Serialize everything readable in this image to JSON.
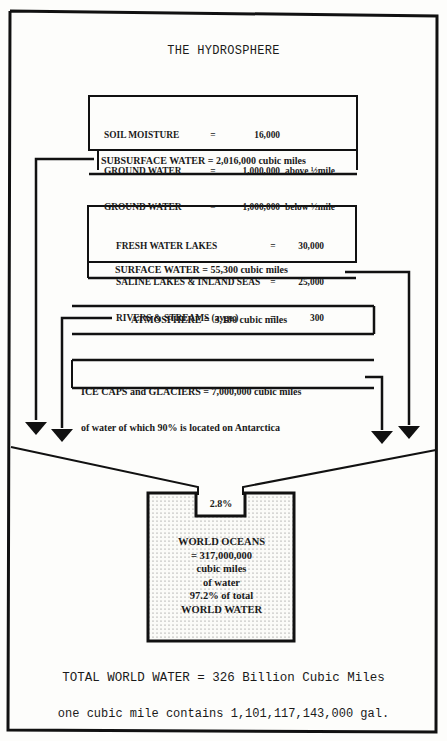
{
  "title": "THE HYDROSPHERE",
  "subsurface": {
    "items": [
      {
        "label": "SOIL MOISTURE",
        "eq": "=",
        "value": "16,000",
        "note": ""
      },
      {
        "label": "GROUND WATER",
        "eq": "=",
        "value": "1,000,000",
        "note": "above ½mile"
      },
      {
        "label": "GROUND WATER",
        "eq": "=",
        "value": "1,000,000",
        "note": "below ½mile"
      }
    ],
    "total": "SUBSURFACE WATER = 2,016,000 cubic miles"
  },
  "surface": {
    "items": [
      {
        "label": "FRESH WATER LAKES",
        "eq": "=",
        "value": "30,000"
      },
      {
        "label": "SALINE LAKES & INLAND SEAS",
        "eq": "=",
        "value": "25,000"
      },
      {
        "label": "RIVERS & STREAMS (avge.)",
        "eq": "=",
        "value": "300"
      }
    ],
    "total": "SURFACE WATER = 55,300 cubic miles"
  },
  "atmosphere": "ATMOSPHERE =  3,100 cubic miles",
  "ice": {
    "line1": "ICE CAPS and GLACIERS = 7,000,000 cubic miles",
    "line2": "of water of which 90% is located on Antarctica"
  },
  "funnel_percent": "2.8%",
  "oceans": {
    "lines": [
      "WORLD OCEANS",
      "= 317,000,000",
      "cubic miles",
      "of water",
      "97.2% of total",
      "WORLD WATER"
    ]
  },
  "total": "TOTAL WORLD WATER = 326 Billion Cubic Miles",
  "gallons": "one cubic mile contains 1,101,117,143,000 gal."
}
